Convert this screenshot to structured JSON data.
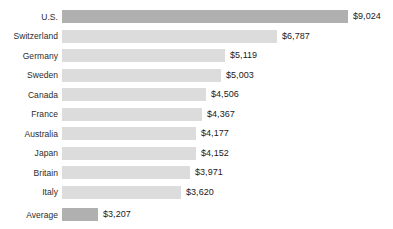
{
  "chart_data": {
    "type": "bar",
    "orientation": "horizontal",
    "title": "",
    "subtitle": "",
    "xlabel": "",
    "ylabel": "",
    "grid": false,
    "legend": null,
    "axis_ticks": [],
    "xlim": [
      0,
      9024
    ],
    "categories": [
      "U.S.",
      "Switzerland",
      "Germany",
      "Sweden",
      "Canada",
      "France",
      "Australia",
      "Japan",
      "Britain",
      "Italy",
      "Average"
    ],
    "values": [
      9024,
      6787,
      5119,
      5003,
      4506,
      4367,
      4177,
      4152,
      3971,
      3620,
      3207
    ],
    "value_labels": [
      "$9,024",
      "$6,787",
      "$5,119",
      "$5,003",
      "$4,506",
      "$4,367",
      "$4,177",
      "$4,152",
      "$3,971",
      "$3,620",
      "$3,207"
    ],
    "bar_pixel_widths": [
      286,
      215,
      163,
      159,
      144,
      140,
      134,
      134,
      128,
      119,
      36
    ],
    "rows": [
      {
        "label": "U.S.",
        "value": 9024,
        "value_label": "$9,024",
        "bar_px": 286,
        "highlight": true,
        "separated": false
      },
      {
        "label": "Switzerland",
        "value": 6787,
        "value_label": "$6,787",
        "bar_px": 215,
        "highlight": false,
        "separated": false
      },
      {
        "label": "Germany",
        "value": 5119,
        "value_label": "$5,119",
        "bar_px": 163,
        "highlight": false,
        "separated": false
      },
      {
        "label": "Sweden",
        "value": 5003,
        "value_label": "$5,003",
        "bar_px": 159,
        "highlight": false,
        "separated": false
      },
      {
        "label": "Canada",
        "value": 4506,
        "value_label": "$4,506",
        "bar_px": 144,
        "highlight": false,
        "separated": false
      },
      {
        "label": "France",
        "value": 4367,
        "value_label": "$4,367",
        "bar_px": 140,
        "highlight": false,
        "separated": false
      },
      {
        "label": "Australia",
        "value": 4177,
        "value_label": "$4,177",
        "bar_px": 134,
        "highlight": false,
        "separated": false
      },
      {
        "label": "Japan",
        "value": 4152,
        "value_label": "$4,152",
        "bar_px": 134,
        "highlight": false,
        "separated": false
      },
      {
        "label": "Britain",
        "value": 3971,
        "value_label": "$3,971",
        "bar_px": 128,
        "highlight": false,
        "separated": false
      },
      {
        "label": "Italy",
        "value": 3620,
        "value_label": "$3,620",
        "bar_px": 119,
        "highlight": false,
        "separated": false
      },
      {
        "label": "Average",
        "value": 3207,
        "value_label": "$3,207",
        "bar_px": 36,
        "highlight": true,
        "separated": true
      }
    ],
    "colors": {
      "bar_default": "#dcdcdc",
      "bar_highlight": "#b0b0b0",
      "background": "#ffffff",
      "label_text": "#2b2b2b",
      "value_text": "#1a1a1a"
    }
  }
}
